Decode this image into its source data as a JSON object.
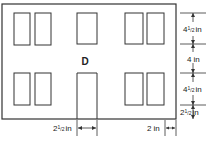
{
  "diagram": {
    "label": "D",
    "stroke_color": "#333333",
    "dimensions": {
      "right": [
        {
          "whole": "4",
          "num": "1",
          "den": "2",
          "unit": "in"
        },
        {
          "whole": "4",
          "num": "",
          "den": "",
          "unit": "in"
        },
        {
          "whole": "4",
          "num": "1",
          "den": "2",
          "unit": "in"
        },
        {
          "whole": "2",
          "num": "1",
          "den": "2",
          "unit": "in"
        }
      ],
      "bottom": [
        {
          "whole": "2",
          "num": "1",
          "den": "2",
          "unit": "in"
        },
        {
          "whole": "2",
          "num": "",
          "den": "",
          "unit": "in"
        }
      ]
    }
  }
}
